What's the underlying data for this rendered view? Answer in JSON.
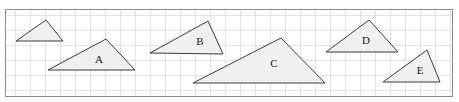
{
  "figure": {
    "canvas": {
      "width": 459,
      "height": 102
    },
    "background_color": "#ffffff"
  },
  "grid": {
    "name": "square-grid-paper",
    "x": 5,
    "y": 9,
    "width": 448,
    "height": 88,
    "cell_size": 15,
    "line_color": "#c8c8c8",
    "border_color": "#8c8c8c",
    "border_width": 1,
    "line_width": 1,
    "columns": 30,
    "rows": 6
  },
  "style": {
    "triangle_fill": "#f0f0f0",
    "triangle_stroke": "#3a3a3a",
    "triangle_stroke_width": 1,
    "label_color": "#1a1a1a",
    "label_font_size": 11
  },
  "triangles": [
    {
      "label": "",
      "name": "triangle-unlabeled",
      "points": "16,41 46,20 63,41",
      "apex": {
        "x": 46,
        "y": 20
      },
      "base_left": {
        "x": 16,
        "y": 41
      },
      "base_right": {
        "x": 63,
        "y": 41
      },
      "base_length": 47,
      "height": 21,
      "label_x": 0,
      "label_y": 0,
      "has_label": false
    },
    {
      "label": "A",
      "name": "triangle-a",
      "points": "48,70 106,39 135,70",
      "apex": {
        "x": 106,
        "y": 39
      },
      "base_left": {
        "x": 48,
        "y": 70
      },
      "base_right": {
        "x": 135,
        "y": 70
      },
      "base_length": 87,
      "height": 31,
      "label_x": 99,
      "label_y": 60,
      "has_label": true
    },
    {
      "label": "B",
      "name": "triangle-b",
      "points": "150,53 208,21 223,54",
      "apex": {
        "x": 208,
        "y": 21
      },
      "base_left": {
        "x": 150,
        "y": 53
      },
      "base_right": {
        "x": 223,
        "y": 54
      },
      "base_length": 73,
      "height": 32,
      "label_x": 200,
      "label_y": 42,
      "has_label": true
    },
    {
      "label": "C",
      "name": "triangle-c",
      "points": "193,83 281,38 325,83",
      "apex": {
        "x": 281,
        "y": 38
      },
      "base_left": {
        "x": 193,
        "y": 83
      },
      "base_right": {
        "x": 325,
        "y": 83
      },
      "base_length": 132,
      "height": 45,
      "label_x": 274,
      "label_y": 64,
      "has_label": true
    },
    {
      "label": "D",
      "name": "triangle-d",
      "points": "326,52 369,20 398,52",
      "apex": {
        "x": 369,
        "y": 20
      },
      "base_left": {
        "x": 326,
        "y": 52
      },
      "base_right": {
        "x": 398,
        "y": 52
      },
      "base_length": 72,
      "height": 32,
      "label_x": 366,
      "label_y": 41,
      "has_label": true
    },
    {
      "label": "E",
      "name": "triangle-e",
      "points": "383,82 427,50 440,82",
      "apex": {
        "x": 427,
        "y": 50
      },
      "base_left": {
        "x": 383,
        "y": 82
      },
      "base_right": {
        "x": 440,
        "y": 82
      },
      "base_length": 57,
      "height": 32,
      "label_x": 420,
      "label_y": 71,
      "has_label": true
    }
  ]
}
